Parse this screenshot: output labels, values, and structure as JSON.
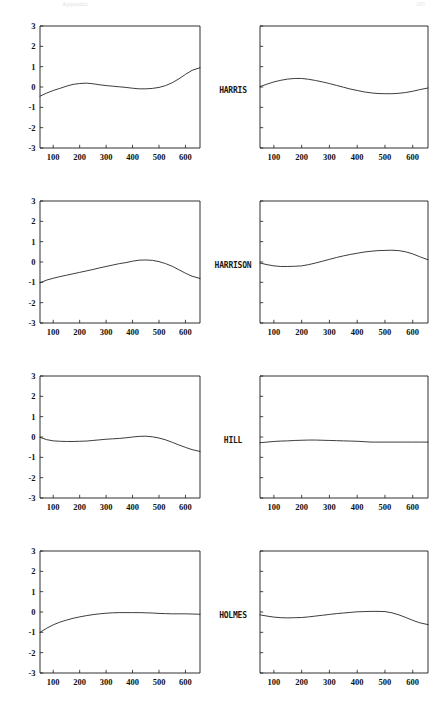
{
  "header": {
    "title": "Appendix",
    "page_number": "185"
  },
  "figure": {
    "row_labels": [
      "HARRIS",
      "HARRISON",
      "HILL",
      "HOLMES"
    ],
    "columns": 2,
    "rows": 4
  },
  "chart_data": [
    {
      "type": "line",
      "panel": "HARRIS-left",
      "row_label": "HARRIS",
      "column": "left",
      "title": "",
      "xlabel": "",
      "ylabel": "",
      "xlim": [
        50,
        655
      ],
      "ylim": [
        -3,
        3
      ],
      "xticks": [
        100,
        200,
        300,
        400,
        500,
        600
      ],
      "yticks": [
        -3,
        -2,
        -1,
        0,
        1,
        2,
        3
      ],
      "ytick_labels": [
        "-3",
        "-2",
        "-1",
        "0",
        "1",
        "2",
        "3"
      ],
      "xtick_labels": [
        "100",
        "200",
        "300",
        "400",
        "500",
        "600"
      ],
      "grid": false,
      "legend": "none",
      "series": [
        {
          "name": "smooth",
          "x": [
            50,
            75,
            100,
            125,
            150,
            175,
            200,
            225,
            250,
            275,
            300,
            325,
            350,
            375,
            400,
            425,
            450,
            475,
            500,
            525,
            550,
            575,
            600,
            625,
            655
          ],
          "y": [
            -0.45,
            -0.3,
            -0.17,
            -0.07,
            0.04,
            0.13,
            0.17,
            0.19,
            0.16,
            0.11,
            0.07,
            0.04,
            0.01,
            -0.02,
            -0.06,
            -0.09,
            -0.09,
            -0.07,
            -0.02,
            0.07,
            0.21,
            0.4,
            0.62,
            0.82,
            0.95
          ]
        }
      ]
    },
    {
      "type": "line",
      "panel": "HARRIS-right",
      "row_label": "HARRIS",
      "column": "right",
      "title": "",
      "xlabel": "",
      "ylabel": "",
      "xlim": [
        50,
        655
      ],
      "ylim": [
        -3,
        3
      ],
      "xticks": [
        100,
        200,
        300,
        400,
        500,
        600
      ],
      "yticks": [
        -3,
        -2,
        -1,
        0,
        1,
        2,
        3
      ],
      "ytick_labels": [],
      "xtick_labels": [
        "100",
        "200",
        "300",
        "400",
        "500",
        "600"
      ],
      "grid": false,
      "legend": "none",
      "series": [
        {
          "name": "smooth",
          "x": [
            50,
            75,
            100,
            125,
            150,
            175,
            200,
            225,
            250,
            275,
            300,
            325,
            350,
            375,
            400,
            425,
            450,
            475,
            500,
            525,
            550,
            575,
            600,
            625,
            655
          ],
          "y": [
            0.02,
            0.14,
            0.25,
            0.33,
            0.39,
            0.42,
            0.42,
            0.38,
            0.32,
            0.25,
            0.17,
            0.08,
            -0.01,
            -0.1,
            -0.17,
            -0.24,
            -0.29,
            -0.32,
            -0.33,
            -0.33,
            -0.31,
            -0.27,
            -0.21,
            -0.13,
            -0.05
          ]
        }
      ]
    },
    {
      "type": "line",
      "panel": "HARRISON-left",
      "row_label": "HARRISON",
      "column": "left",
      "title": "",
      "xlabel": "",
      "ylabel": "",
      "xlim": [
        50,
        655
      ],
      "ylim": [
        -3,
        3
      ],
      "xticks": [
        100,
        200,
        300,
        400,
        500,
        600
      ],
      "yticks": [
        -3,
        -2,
        -1,
        0,
        1,
        2,
        3
      ],
      "ytick_labels": [
        "-3",
        "-2",
        "-1",
        "0",
        "1",
        "2",
        "3"
      ],
      "xtick_labels": [
        "100",
        "200",
        "300",
        "400",
        "500",
        "600"
      ],
      "grid": false,
      "legend": "none",
      "series": [
        {
          "name": "smooth",
          "x": [
            50,
            75,
            100,
            125,
            150,
            175,
            200,
            225,
            250,
            275,
            300,
            325,
            350,
            375,
            400,
            425,
            450,
            475,
            500,
            525,
            550,
            575,
            600,
            625,
            655
          ],
          "y": [
            -1.02,
            -0.89,
            -0.8,
            -0.72,
            -0.65,
            -0.58,
            -0.51,
            -0.44,
            -0.37,
            -0.29,
            -0.22,
            -0.15,
            -0.08,
            -0.03,
            0.04,
            0.09,
            0.1,
            0.08,
            0.02,
            -0.08,
            -0.21,
            -0.38,
            -0.55,
            -0.7,
            -0.81
          ]
        }
      ]
    },
    {
      "type": "line",
      "panel": "HARRISON-right",
      "row_label": "HARRISON",
      "column": "right",
      "title": "",
      "xlabel": "",
      "ylabel": "",
      "xlim": [
        50,
        655
      ],
      "ylim": [
        -3,
        3
      ],
      "xticks": [
        100,
        200,
        300,
        400,
        500,
        600
      ],
      "yticks": [
        -3,
        -2,
        -1,
        0,
        1,
        2,
        3
      ],
      "ytick_labels": [],
      "xtick_labels": [
        "100",
        "200",
        "300",
        "400",
        "500",
        "600"
      ],
      "grid": false,
      "legend": "none",
      "series": [
        {
          "name": "smooth",
          "x": [
            50,
            75,
            100,
            125,
            150,
            175,
            200,
            225,
            250,
            275,
            300,
            325,
            350,
            375,
            400,
            425,
            450,
            475,
            500,
            525,
            550,
            575,
            600,
            625,
            655
          ],
          "y": [
            -0.05,
            -0.13,
            -0.19,
            -0.22,
            -0.22,
            -0.21,
            -0.19,
            -0.13,
            -0.05,
            0.04,
            0.13,
            0.22,
            0.3,
            0.37,
            0.43,
            0.49,
            0.53,
            0.56,
            0.57,
            0.58,
            0.56,
            0.5,
            0.4,
            0.26,
            0.11
          ]
        }
      ]
    },
    {
      "type": "line",
      "panel": "HILL-left",
      "row_label": "HILL",
      "column": "left",
      "title": "",
      "xlabel": "",
      "ylabel": "",
      "xlim": [
        50,
        655
      ],
      "ylim": [
        -3,
        3
      ],
      "xticks": [
        100,
        200,
        300,
        400,
        500,
        600
      ],
      "yticks": [
        -3,
        -2,
        -1,
        0,
        1,
        2,
        3
      ],
      "ytick_labels": [
        "-3",
        "-2",
        "-1",
        "0",
        "1",
        "2",
        "3"
      ],
      "xtick_labels": [
        "100",
        "200",
        "300",
        "400",
        "500",
        "600"
      ],
      "grid": false,
      "legend": "none",
      "series": [
        {
          "name": "smooth",
          "x": [
            50,
            75,
            100,
            125,
            150,
            175,
            200,
            225,
            250,
            275,
            300,
            325,
            350,
            375,
            400,
            425,
            450,
            475,
            500,
            525,
            550,
            575,
            600,
            625,
            655
          ],
          "y": [
            -0.02,
            -0.13,
            -0.19,
            -0.21,
            -0.22,
            -0.22,
            -0.21,
            -0.2,
            -0.17,
            -0.14,
            -0.11,
            -0.09,
            -0.07,
            -0.04,
            0.0,
            0.03,
            0.04,
            0.01,
            -0.05,
            -0.14,
            -0.26,
            -0.39,
            -0.51,
            -0.62,
            -0.71
          ]
        }
      ]
    },
    {
      "type": "line",
      "panel": "HILL-right",
      "row_label": "HILL",
      "column": "right",
      "title": "",
      "xlabel": "",
      "ylabel": "",
      "xlim": [
        50,
        655
      ],
      "ylim": [
        -3,
        3
      ],
      "xticks": [
        100,
        200,
        300,
        400,
        500,
        600
      ],
      "yticks": [
        -3,
        -2,
        -1,
        0,
        1,
        2,
        3
      ],
      "ytick_labels": [],
      "xtick_labels": [
        "100",
        "200",
        "300",
        "400",
        "500",
        "600"
      ],
      "grid": false,
      "legend": "none",
      "series": [
        {
          "name": "smooth",
          "x": [
            50,
            75,
            100,
            125,
            150,
            175,
            200,
            225,
            250,
            275,
            300,
            325,
            350,
            375,
            400,
            425,
            450,
            475,
            500,
            525,
            550,
            575,
            600,
            625,
            655
          ],
          "y": [
            -0.28,
            -0.25,
            -0.22,
            -0.2,
            -0.19,
            -0.17,
            -0.16,
            -0.15,
            -0.15,
            -0.16,
            -0.17,
            -0.18,
            -0.19,
            -0.2,
            -0.21,
            -0.23,
            -0.25,
            -0.25,
            -0.25,
            -0.25,
            -0.25,
            -0.25,
            -0.25,
            -0.25,
            -0.25
          ]
        }
      ]
    },
    {
      "type": "line",
      "panel": "HOLMES-left",
      "row_label": "HOLMES",
      "column": "left",
      "title": "",
      "xlabel": "",
      "ylabel": "",
      "xlim": [
        50,
        655
      ],
      "ylim": [
        -3,
        3
      ],
      "xticks": [
        100,
        200,
        300,
        400,
        500,
        600
      ],
      "yticks": [
        -3,
        -2,
        -1,
        0,
        1,
        2,
        3
      ],
      "ytick_labels": [
        "-3",
        "-2",
        "-1",
        "0",
        "1",
        "2",
        "3"
      ],
      "xtick_labels": [
        "100",
        "200",
        "300",
        "400",
        "500",
        "600"
      ],
      "grid": false,
      "legend": "none",
      "series": [
        {
          "name": "smooth",
          "x": [
            50,
            75,
            100,
            125,
            150,
            175,
            200,
            225,
            250,
            275,
            300,
            325,
            350,
            375,
            400,
            425,
            450,
            475,
            500,
            525,
            550,
            575,
            600,
            625,
            655
          ],
          "y": [
            -1.0,
            -0.8,
            -0.63,
            -0.5,
            -0.4,
            -0.31,
            -0.24,
            -0.18,
            -0.13,
            -0.09,
            -0.06,
            -0.04,
            -0.03,
            -0.03,
            -0.03,
            -0.03,
            -0.04,
            -0.05,
            -0.07,
            -0.08,
            -0.09,
            -0.09,
            -0.09,
            -0.1,
            -0.11
          ]
        }
      ]
    },
    {
      "type": "line",
      "panel": "HOLMES-right",
      "row_label": "HOLMES",
      "column": "right",
      "title": "",
      "xlabel": "",
      "ylabel": "",
      "xlim": [
        50,
        655
      ],
      "ylim": [
        -3,
        3
      ],
      "xticks": [
        100,
        200,
        300,
        400,
        500,
        600
      ],
      "yticks": [
        -3,
        -2,
        -1,
        0,
        1,
        2,
        3
      ],
      "ytick_labels": [],
      "xtick_labels": [
        "100",
        "200",
        "300",
        "400",
        "500",
        "600"
      ],
      "grid": false,
      "legend": "none",
      "series": [
        {
          "name": "smooth",
          "x": [
            50,
            75,
            100,
            125,
            150,
            175,
            200,
            225,
            250,
            275,
            300,
            325,
            350,
            375,
            400,
            425,
            450,
            475,
            500,
            525,
            550,
            575,
            600,
            625,
            655
          ],
          "y": [
            -0.14,
            -0.2,
            -0.25,
            -0.28,
            -0.29,
            -0.28,
            -0.27,
            -0.24,
            -0.2,
            -0.16,
            -0.12,
            -0.08,
            -0.05,
            -0.02,
            0.01,
            0.02,
            0.03,
            0.03,
            0.02,
            -0.04,
            -0.14,
            -0.27,
            -0.41,
            -0.53,
            -0.62
          ]
        }
      ]
    }
  ]
}
